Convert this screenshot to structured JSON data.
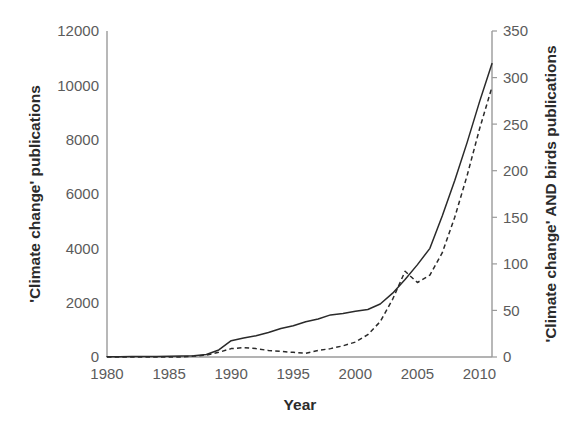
{
  "chart_data": {
    "type": "line",
    "title": "",
    "xlabel": "Year",
    "ylabel": "'Climate change' publications",
    "y2label": "'Climate change' AND birds publications",
    "xlim": [
      1980,
      2011
    ],
    "ylim": [
      0,
      12000
    ],
    "y2lim": [
      0,
      350
    ],
    "grid": false,
    "legend": "none",
    "x_ticks": [
      1980,
      1985,
      1990,
      1995,
      2000,
      2005,
      2010
    ],
    "x_tick_labels": [
      "1980",
      "1985",
      "1990",
      "1995",
      "2000",
      "2005",
      "2010"
    ],
    "y_ticks": [
      0,
      2000,
      4000,
      6000,
      8000,
      10000,
      12000
    ],
    "y_tick_labels": [
      "0",
      "2000",
      "4000",
      "6000",
      "8000",
      "10000",
      "12000"
    ],
    "y2_ticks": [
      0,
      50,
      100,
      150,
      200,
      250,
      300,
      350
    ],
    "y2_tick_labels": [
      "0",
      "50",
      "100",
      "150",
      "200",
      "250",
      "300",
      "350"
    ],
    "x": [
      1980,
      1981,
      1982,
      1983,
      1984,
      1985,
      1986,
      1987,
      1988,
      1989,
      1990,
      1991,
      1992,
      1993,
      1994,
      1995,
      1996,
      1997,
      1998,
      1999,
      2000,
      2001,
      2002,
      2003,
      2004,
      2005,
      2006,
      2007,
      2008,
      2009,
      2010,
      2011
    ],
    "series": [
      {
        "name": "'Climate change' publications",
        "axis": "left",
        "style": "solid",
        "color": "#2a2a2a",
        "values": [
          10,
          12,
          15,
          18,
          22,
          28,
          35,
          50,
          90,
          260,
          600,
          700,
          780,
          900,
          1050,
          1150,
          1300,
          1400,
          1550,
          1600,
          1680,
          1750,
          1950,
          2350,
          2850,
          3400,
          4000,
          5200,
          6500,
          7900,
          9400,
          10800
        ]
      },
      {
        "name": "'Climate change' AND birds publications",
        "axis": "right",
        "style": "dashed",
        "color": "#2a2a2a",
        "values": [
          0,
          0,
          0,
          0,
          0,
          0,
          0,
          1,
          2,
          5,
          9,
          10,
          9,
          7,
          6,
          5,
          4,
          7,
          9,
          12,
          16,
          24,
          38,
          62,
          92,
          80,
          88,
          112,
          150,
          195,
          245,
          290
        ]
      }
    ],
    "annotations": []
  }
}
